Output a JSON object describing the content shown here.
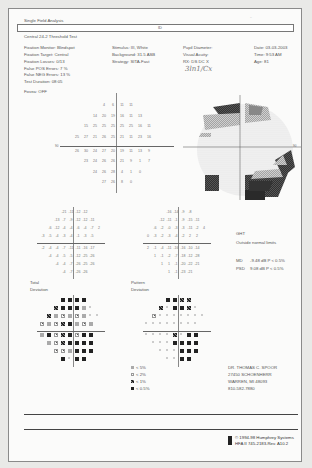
{
  "header": {
    "title": "Single Field Analysis",
    "eye_label": "ID",
    "test_name": "Central 24-2 Threshold Test",
    "top_right_scribble": "~"
  },
  "params": {
    "left": [
      "Fixation Monitor: Blindspot",
      "Fixation Target: Central",
      "Fixation Losses: 0/13",
      "False POS Errors: 7 %",
      "False NEG Errors: 13 %",
      "Test Duration: 08:05"
    ],
    "fovea": "Fovea: OFF",
    "middle": [
      "Stimulus: III, White",
      "Background: 31.5 ASB",
      "Strategy: SITA-Fast"
    ],
    "pupil": [
      "Pupil Diameter:",
      "Visual Acuity:",
      "RX:     DS     DC  X"
    ],
    "handwritten": "3ln1/Cx",
    "right": [
      "Date: 03-03-2003",
      "Time: 9:53 AM",
      "Age: 81"
    ]
  },
  "threshold_grid": {
    "label_left": "90",
    "rows": [
      [
        "4",
        "6",
        "11",
        "11"
      ],
      [
        "14",
        "20",
        "19",
        "16",
        "11",
        "13"
      ],
      [
        "15",
        "25",
        "25",
        "25",
        "25",
        "25",
        "16",
        "11"
      ],
      [
        "25",
        "27",
        "21",
        "26",
        "25",
        "21",
        "11",
        "23",
        "16"
      ],
      [
        "26",
        "30",
        "24",
        "27",
        "20",
        "19",
        "11",
        "13",
        "9"
      ],
      [
        "23",
        "24",
        "26",
        "26",
        "21",
        "9",
        "1",
        "7"
      ],
      [
        "24",
        "26",
        "28",
        "4",
        "1",
        "0"
      ],
      [
        "27",
        "26",
        "8",
        "0"
      ]
    ]
  },
  "grayscale": {
    "label_right": "90"
  },
  "total_deviation_values": {
    "rows": [
      [
        "-21",
        "-11",
        "-12",
        "-12"
      ],
      [
        "-13",
        "-7",
        "-9",
        "-12",
        "-12",
        "-11"
      ],
      [
        "-6",
        "-12",
        "-4",
        "-4",
        "-6",
        "-4",
        "-7",
        "2"
      ],
      [
        "-3",
        "-5",
        "-4",
        "-3",
        "-4",
        "-1",
        "-3",
        "-5"
      ],
      [
        "-2",
        "-4",
        "-4",
        "-7",
        "-11",
        "-11",
        "-16",
        "-17"
      ],
      [
        "-4",
        "-4",
        "-5",
        "-5",
        "-12",
        "-25",
        "-26"
      ],
      [
        "-4",
        "-4",
        "-7",
        "-26",
        "-25",
        "-26"
      ],
      [
        "-4",
        "-7",
        "-26",
        "-26"
      ]
    ]
  },
  "pattern_deviation_values": {
    "rows": [
      [
        "-16",
        "-14",
        "-9",
        "-8"
      ],
      [
        "-12",
        "-11",
        "-1",
        "-9",
        "-15",
        "-11"
      ],
      [
        "-6",
        "-2",
        "-0",
        "-3",
        "-3",
        "-11",
        "-2",
        "4"
      ],
      [
        "0",
        "-3",
        "-2",
        "-3",
        "-4",
        "-2",
        "2",
        "2"
      ],
      [
        "2",
        "-1",
        "-4",
        "-11",
        "-16",
        "-16",
        "-10",
        "-14"
      ],
      [
        "1",
        "-1",
        "-2",
        "-7",
        "-18",
        "-12",
        "-28"
      ],
      [
        "1",
        "1",
        "-1",
        "-20",
        "-22",
        "-21"
      ],
      [
        "1",
        "-1",
        "-23",
        "-21"
      ]
    ]
  },
  "indices": {
    "ght_label": "GHT",
    "ght_value": "Outside normal limits",
    "md_label": "MD",
    "md_value": "-9.48 dB P < 0.5%",
    "psd_label": "PSD",
    "psd_value": "9.08 dB P < 0.5%"
  },
  "plot_labels": {
    "total": "Total",
    "total_sub": "Deviation",
    "pattern": "Pattern",
    "pattern_sub": "Deviation"
  },
  "legend": [
    {
      "symbol": "dot",
      "label": "< 5%"
    },
    {
      "symbol": "mid",
      "label": "< 2%"
    },
    {
      "symbol": "dark",
      "label": "< 1%"
    },
    {
      "symbol": "black",
      "label": "< 0.5%"
    }
  ],
  "doctor": [
    "DR. THOMAS C. SPOOR",
    "27450 SCHOENHERR",
    "WARREN, MI 48093",
    "810-582-7880"
  ],
  "footer": {
    "copyright": "© 1994-98 Humphrey Systems",
    "model": "HFA II 745-2183-Rev. A10.2"
  }
}
